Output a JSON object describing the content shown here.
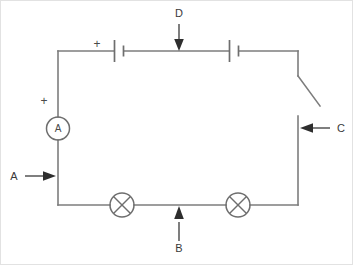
{
  "diagram": {
    "type": "electrical-circuit-schematic",
    "background_color": "#ffffff",
    "wire_color": "#7d7d7d",
    "label_color": "#3a3a3a",
    "pointer_color": "#2e2e2e"
  },
  "labels": {
    "a": "A",
    "b": "B",
    "c": "C",
    "d": "D"
  },
  "components": {
    "ammeter": {
      "symbol_letter": "A",
      "polarity_marker": "+",
      "name": "ammeter"
    },
    "cell_one": {
      "polarity_marker": "+",
      "name": "battery-cell"
    },
    "cell_two": {
      "name": "battery-cell"
    },
    "switch": {
      "name": "open-switch",
      "state": "open"
    },
    "lamp_one": {
      "name": "lamp"
    },
    "lamp_two": {
      "name": "lamp"
    }
  },
  "callouts": [
    {
      "label": "A",
      "points_to": "left-wire-segment",
      "arrow_direction": "right"
    },
    {
      "label": "B",
      "points_to": "bottom-wire-segment",
      "arrow_direction": "up"
    },
    {
      "label": "C",
      "points_to": "right-wire-segment",
      "arrow_direction": "left"
    },
    {
      "label": "D",
      "points_to": "top-wire-segment",
      "arrow_direction": "down"
    }
  ]
}
